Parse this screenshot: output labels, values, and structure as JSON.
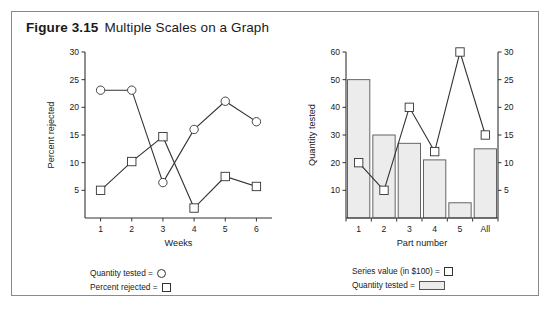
{
  "figure": {
    "number": "Figure 3.15",
    "title": "Multiple Scales on a Graph"
  },
  "colors": {
    "frame_border": "#8a8a8a",
    "axis": "#333333",
    "marker_stroke": "#333333",
    "marker_fill": "#ffffff",
    "bar_fill": "#ececec",
    "bar_stroke": "#555555",
    "text": "#1a1a1a"
  },
  "left_legend": {
    "items": [
      {
        "label": "Quantity tested =",
        "symbol": "circle-marker-icon"
      },
      {
        "label": "Percent rejected =",
        "symbol": "square-marker-icon"
      }
    ]
  },
  "right_legend": {
    "items": [
      {
        "label": "Series value (in $100) =",
        "symbol": "square-marker-icon"
      },
      {
        "label": "Quantity tested =",
        "symbol": "bar-swatch-icon"
      }
    ]
  },
  "chart_data": [
    {
      "id": "left-chart",
      "type": "line",
      "title": "",
      "xlabel": "Weeks",
      "ylabel": "Percent rejected",
      "categories": [
        "1",
        "2",
        "3",
        "4",
        "5",
        "6"
      ],
      "x": [
        1,
        2,
        3,
        4,
        5,
        6
      ],
      "ylim": [
        0,
        30
      ],
      "yticks": [
        5,
        10,
        15,
        20,
        25,
        30
      ],
      "ytick_labels": [
        "5",
        "10",
        "15",
        "20",
        "25",
        "30"
      ],
      "grid": false,
      "legend_position": "below",
      "series": [
        {
          "name": "Quantity tested",
          "marker": "circle",
          "values": [
            23.1,
            23.1,
            6.4,
            16.0,
            21.1,
            17.4
          ]
        },
        {
          "name": "Percent rejected",
          "marker": "square",
          "values": [
            5.0,
            10.2,
            14.7,
            1.8,
            7.5,
            5.7
          ]
        }
      ]
    },
    {
      "id": "right-chart",
      "type": "bar",
      "title": "",
      "xlabel": "Part number",
      "ylabel": "Quantity tested",
      "y2label": "",
      "categories": [
        "1",
        "2",
        "3",
        "4",
        "5",
        "All"
      ],
      "ylim": [
        0,
        60
      ],
      "yticks": [
        10,
        20,
        30,
        40,
        50,
        60
      ],
      "ytick_labels": [
        "10",
        "20",
        "30",
        "40",
        "50",
        "60"
      ],
      "y2lim": [
        0,
        30
      ],
      "y2ticks": [
        5,
        10,
        15,
        20,
        25,
        30
      ],
      "y2tick_labels": [
        "5",
        "10",
        "15",
        "20",
        "25",
        "30"
      ],
      "grid": false,
      "legend_position": "below",
      "series": [
        {
          "name": "Quantity tested",
          "type": "bar",
          "axis": "left",
          "values": [
            50,
            30,
            27,
            21,
            5.5,
            25
          ]
        },
        {
          "name": "Series value (in $100)",
          "type": "line",
          "marker": "square",
          "axis": "right",
          "values": [
            10,
            5,
            20,
            12,
            30,
            15
          ]
        }
      ]
    }
  ]
}
